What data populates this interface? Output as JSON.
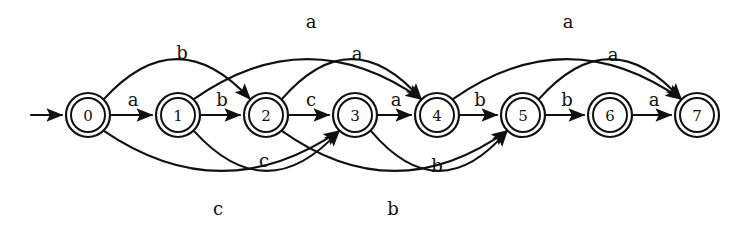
{
  "diagram": {
    "type": "state-transition-diagram",
    "colors": {
      "stroke": "#111111",
      "background": "#ffffff"
    },
    "start_state": "0",
    "states": [
      {
        "id": "0",
        "label": "0",
        "cx": 88,
        "cy": 115,
        "accepting": true
      },
      {
        "id": "1",
        "label": "1",
        "cx": 178,
        "cy": 115,
        "accepting": true
      },
      {
        "id": "2",
        "label": "2",
        "cx": 266,
        "cy": 115,
        "accepting": true
      },
      {
        "id": "3",
        "label": "3",
        "cx": 355,
        "cy": 115,
        "accepting": true
      },
      {
        "id": "4",
        "label": "4",
        "cx": 437,
        "cy": 115,
        "accepting": true
      },
      {
        "id": "5",
        "label": "5",
        "cx": 523,
        "cy": 115,
        "accepting": true
      },
      {
        "id": "6",
        "label": "6",
        "cx": 610,
        "cy": 115,
        "accepting": true
      },
      {
        "id": "7",
        "label": "7",
        "cx": 697,
        "cy": 115,
        "accepting": true
      }
    ],
    "transitions": [
      {
        "id": "t0",
        "from": "0",
        "to": "1",
        "label": "a",
        "label_x": 133,
        "label_y": 99,
        "shape": "straight"
      },
      {
        "id": "t1",
        "from": "1",
        "to": "2",
        "label": "b",
        "label_x": 222,
        "label_y": 99,
        "shape": "straight"
      },
      {
        "id": "t2",
        "from": "2",
        "to": "3",
        "label": "c",
        "label_x": 311,
        "label_y": 99,
        "shape": "straight"
      },
      {
        "id": "t3",
        "from": "3",
        "to": "4",
        "label": "a",
        "label_x": 396,
        "label_y": 99,
        "shape": "straight"
      },
      {
        "id": "t4",
        "from": "4",
        "to": "5",
        "label": "b",
        "label_x": 480,
        "label_y": 99,
        "shape": "straight"
      },
      {
        "id": "t5",
        "from": "5",
        "to": "6",
        "label": "b",
        "label_x": 567,
        "label_y": 99,
        "shape": "straight"
      },
      {
        "id": "t6",
        "from": "6",
        "to": "7",
        "label": "a",
        "label_x": 654,
        "label_y": 99,
        "shape": "straight"
      },
      {
        "id": "t7",
        "from": "0",
        "to": "2",
        "label": "b",
        "label_x": 182,
        "label_y": 52,
        "shape": "arc-above"
      },
      {
        "id": "t8",
        "from": "1",
        "to": "4",
        "label": "a",
        "label_x": 311,
        "label_y": 21,
        "shape": "arc-above"
      },
      {
        "id": "t9",
        "from": "2",
        "to": "4",
        "label": "a",
        "label_x": 357,
        "label_y": 53,
        "shape": "arc-above"
      },
      {
        "id": "t10",
        "from": "4",
        "to": "7",
        "label": "a",
        "label_x": 568,
        "label_y": 21,
        "shape": "arc-above"
      },
      {
        "id": "t11",
        "from": "5",
        "to": "7",
        "label": "a",
        "label_x": 613,
        "label_y": 54,
        "shape": "arc-above"
      },
      {
        "id": "t12",
        "from": "1",
        "to": "3",
        "label": "c",
        "label_x": 264,
        "label_y": 160,
        "shape": "arc-below"
      },
      {
        "id": "t13",
        "from": "0",
        "to": "3",
        "label": "c",
        "label_x": 218,
        "label_y": 208,
        "shape": "arc-below"
      },
      {
        "id": "t14",
        "from": "3",
        "to": "5",
        "label": "b",
        "label_x": 437,
        "label_y": 165,
        "shape": "arc-below"
      },
      {
        "id": "t15",
        "from": "2",
        "to": "5",
        "label": "b",
        "label_x": 393,
        "label_y": 208,
        "shape": "arc-below"
      }
    ],
    "start_arrow": {
      "x1": 31,
      "y1": 115,
      "x2": 62,
      "y2": 115
    }
  }
}
